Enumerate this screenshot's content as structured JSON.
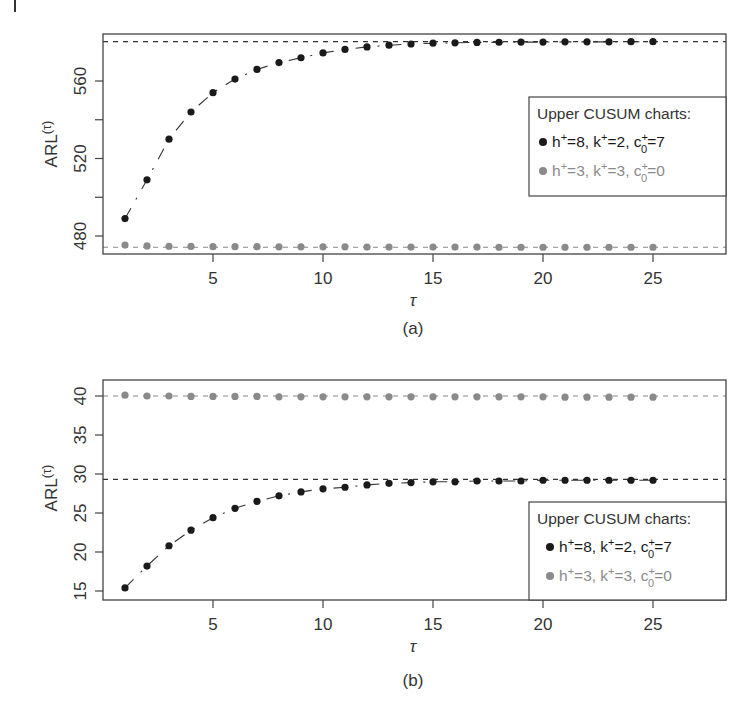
{
  "figure": {
    "panels": [
      {
        "caption": "(a)",
        "ylabel_base": "ARL",
        "ylabel_sup": "(τ)",
        "xlabel": "τ",
        "legend": {
          "title": "Upper CUSUM charts:",
          "entries": [
            {
              "h": "8",
              "k": "2",
              "c0": "7",
              "color": "#1a1a1a"
            },
            {
              "h": "3",
              "k": "3",
              "c0": "0",
              "color": "#8a8a8a"
            }
          ]
        }
      },
      {
        "caption": "(b)",
        "ylabel_base": "ARL",
        "ylabel_sup": "(τ)",
        "xlabel": "τ",
        "legend": {
          "title": "Upper CUSUM charts:",
          "entries": [
            {
              "h": "8",
              "k": "2",
              "c0": "7",
              "color": "#1a1a1a"
            },
            {
              "h": "3",
              "k": "3",
              "c0": "0",
              "color": "#8a8a8a"
            }
          ]
        }
      }
    ]
  },
  "chart_data": [
    {
      "type": "scatter",
      "title": "(a)",
      "xlabel": "τ",
      "ylabel": "ARL(τ)",
      "x": [
        1,
        2,
        3,
        4,
        5,
        6,
        7,
        8,
        9,
        10,
        11,
        12,
        13,
        14,
        15,
        16,
        17,
        18,
        19,
        20,
        21,
        22,
        23,
        24,
        25
      ],
      "xticks": [
        5,
        10,
        15,
        20,
        25
      ],
      "yticks": [
        480,
        520,
        560
      ],
      "xlim": [
        0,
        26
      ],
      "ylim": [
        472,
        583
      ],
      "grid": false,
      "legend_position": "right-center",
      "legend_title": "Upper CUSUM charts:",
      "series": [
        {
          "name": "h+=8, k+=2, c0+=7",
          "color": "#1a1a1a",
          "asymptote": 580.3,
          "values": [
            489,
            509,
            530,
            544,
            554,
            561,
            566,
            569.5,
            572,
            574.5,
            576.3,
            577.6,
            578.5,
            579.1,
            579.5,
            579.7,
            579.9,
            580.0,
            580.1,
            580.1,
            580.2,
            580.2,
            580.2,
            580.3,
            580.3
          ]
        },
        {
          "name": "h+=3, k+=3, c0+=0",
          "color": "#8a8a8a",
          "asymptote": 474.2,
          "values": [
            475.3,
            474.9,
            474.7,
            474.6,
            474.5,
            474.5,
            474.5,
            474.4,
            474.4,
            474.4,
            474.4,
            474.3,
            474.3,
            474.3,
            474.3,
            474.3,
            474.3,
            474.2,
            474.2,
            474.2,
            474.2,
            474.2,
            474.2,
            474.2,
            474.2
          ]
        }
      ]
    },
    {
      "type": "scatter",
      "title": "(b)",
      "xlabel": "τ",
      "ylabel": "ARL(τ)",
      "x": [
        1,
        2,
        3,
        4,
        5,
        6,
        7,
        8,
        9,
        10,
        11,
        12,
        13,
        14,
        15,
        16,
        17,
        18,
        19,
        20,
        21,
        22,
        23,
        24,
        25
      ],
      "xticks": [
        5,
        10,
        15,
        20,
        25
      ],
      "yticks": [
        15,
        20,
        25,
        30,
        35,
        40
      ],
      "xlim": [
        0,
        26
      ],
      "ylim": [
        14,
        42
      ],
      "grid": false,
      "legend_position": "bottom-right",
      "legend_title": "Upper CUSUM charts:",
      "series": [
        {
          "name": "h+=8, k+=2, c0+=7",
          "color": "#1a1a1a",
          "asymptote": 29.3,
          "values": [
            15.4,
            18.2,
            20.8,
            22.8,
            24.4,
            25.6,
            26.5,
            27.2,
            27.7,
            28.1,
            28.3,
            28.6,
            28.8,
            28.9,
            29.0,
            29.0,
            29.1,
            29.1,
            29.1,
            29.2,
            29.2,
            29.2,
            29.2,
            29.2,
            29.2
          ]
        },
        {
          "name": "h+=3, k+=3, c0+=0",
          "color": "#8a8a8a",
          "asymptote": 40.0,
          "values": [
            40.1,
            40.0,
            40.0,
            39.95,
            39.95,
            39.95,
            39.95,
            39.9,
            39.9,
            39.9,
            39.9,
            39.9,
            39.9,
            39.9,
            39.9,
            39.9,
            39.9,
            39.9,
            39.9,
            39.9,
            39.85,
            39.85,
            39.85,
            39.85,
            39.85
          ]
        }
      ]
    }
  ]
}
